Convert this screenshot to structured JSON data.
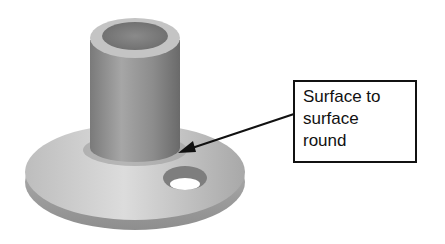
{
  "figure": {
    "callout": {
      "text": "Surface to\nsurface\nround"
    },
    "colors": {
      "stroke": "#111111",
      "base_light": "#d8d8d8",
      "base_dark": "#9a9a9a",
      "cylinder_light": "#b0b0b0",
      "cylinder_dark": "#6f6f6f",
      "bore": "#7a7a7a"
    }
  }
}
